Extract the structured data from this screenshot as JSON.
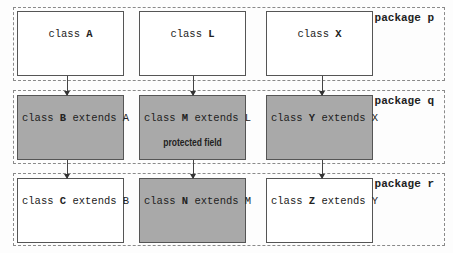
{
  "packages": [
    {
      "label": "package p"
    },
    {
      "label": "package q"
    },
    {
      "label": "package r"
    }
  ],
  "classes": {
    "A": {
      "prefix": "class ",
      "name": "A",
      "suffix": "",
      "fill": "white"
    },
    "L": {
      "prefix": "class ",
      "name": "L",
      "suffix": "",
      "fill": "white"
    },
    "X": {
      "prefix": "class ",
      "name": "X",
      "suffix": "",
      "fill": "white"
    },
    "B": {
      "prefix": "class ",
      "name": "B",
      "suffix": " extends A",
      "fill": "gray"
    },
    "M": {
      "prefix": "class ",
      "name": "M",
      "suffix": " extends L",
      "fill": "gray",
      "note": "protected field"
    },
    "Y": {
      "prefix": "class ",
      "name": "Y",
      "suffix": " extends X",
      "fill": "gray"
    },
    "C": {
      "prefix": "class ",
      "name": "C",
      "suffix": " extends B",
      "fill": "white"
    },
    "N": {
      "prefix": "class ",
      "name": "N",
      "suffix": " extends M",
      "fill": "gray"
    },
    "Z": {
      "prefix": "class ",
      "name": "Z",
      "suffix": " extends Y",
      "fill": "white"
    }
  },
  "colors": {
    "gray_fill": "#a9a9a9",
    "white_fill": "#ffffff",
    "border": "#555555"
  }
}
